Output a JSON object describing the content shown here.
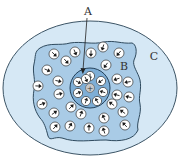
{
  "diagram": {
    "labels": {
      "a": "A",
      "b": "B",
      "c": "C"
    },
    "center_charge": "+",
    "colors": {
      "outer_region": "#d6e8f5",
      "outer_stroke": "#3d5566",
      "middle_region": "#a9cbe6",
      "middle_stroke": "#2f4a5e",
      "inner_region": "#7eaed6",
      "inner_stroke": "#24415a",
      "molecule_fill": "#ffffff",
      "arrow": "#1b1b1b"
    },
    "inner_molecules": [
      {
        "x": 90,
        "y": 76,
        "angle": 90
      },
      {
        "x": 101,
        "y": 81,
        "angle": 135
      },
      {
        "x": 103,
        "y": 92,
        "angle": 180
      },
      {
        "x": 97,
        "y": 101,
        "angle": 225
      },
      {
        "x": 86,
        "y": 101,
        "angle": 270
      },
      {
        "x": 78,
        "y": 93,
        "angle": 315
      },
      {
        "x": 78,
        "y": 82,
        "angle": 45
      },
      {
        "x": 86,
        "y": 79,
        "angle": 80
      }
    ],
    "outer_molecules": [
      {
        "x": 54,
        "y": 54,
        "angle": 60
      },
      {
        "x": 66,
        "y": 61,
        "angle": 30
      },
      {
        "x": 75,
        "y": 52,
        "angle": 70
      },
      {
        "x": 91,
        "y": 53,
        "angle": 90
      },
      {
        "x": 103,
        "y": 47,
        "angle": 110
      },
      {
        "x": 119,
        "y": 53,
        "angle": 120
      },
      {
        "x": 106,
        "y": 65,
        "angle": 110
      },
      {
        "x": 47,
        "y": 70,
        "angle": 40
      },
      {
        "x": 58,
        "y": 81,
        "angle": 20
      },
      {
        "x": 38,
        "y": 86,
        "angle": 0
      },
      {
        "x": 59,
        "y": 94,
        "angle": 10
      },
      {
        "x": 117,
        "y": 79,
        "angle": 150
      },
      {
        "x": 128,
        "y": 82,
        "angle": 160
      },
      {
        "x": 117,
        "y": 95,
        "angle": 170
      },
      {
        "x": 129,
        "y": 97,
        "angle": 190
      },
      {
        "x": 42,
        "y": 104,
        "angle": 350
      },
      {
        "x": 54,
        "y": 113,
        "angle": 340
      },
      {
        "x": 71,
        "y": 107,
        "angle": 310
      },
      {
        "x": 81,
        "y": 114,
        "angle": 290
      },
      {
        "x": 112,
        "y": 104,
        "angle": 210
      },
      {
        "x": 123,
        "y": 112,
        "angle": 200
      },
      {
        "x": 55,
        "y": 127,
        "angle": 330
      },
      {
        "x": 70,
        "y": 126,
        "angle": 300
      },
      {
        "x": 89,
        "y": 128,
        "angle": 270
      },
      {
        "x": 104,
        "y": 118,
        "angle": 240
      },
      {
        "x": 104,
        "y": 131,
        "angle": 240
      },
      {
        "x": 125,
        "y": 125,
        "angle": 210
      }
    ]
  }
}
